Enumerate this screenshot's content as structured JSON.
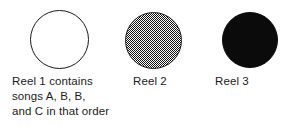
{
  "figure": {
    "background_color": "#ffffff",
    "width": 284,
    "height": 137
  },
  "reels": [
    {
      "id": "reel-1",
      "label": "Reel 1",
      "caption": "Reel 1 contains\nsongs A, B, B,\nand C in that order",
      "fill_style": "empty",
      "fill_color": "#ffffff",
      "stroke_color": "#1a1a1a",
      "contents": [
        "A",
        "B",
        "B",
        "C"
      ],
      "contents_description": "songs A, B, B, and C in that order"
    },
    {
      "id": "reel-2",
      "label": "Reel 2",
      "caption": "Reel 2",
      "fill_style": "dither",
      "fill_color": "#808080",
      "stroke_color": "#1a1a1a",
      "contents": [],
      "contents_description": ""
    },
    {
      "id": "reel-3",
      "label": "Reel 3",
      "caption": "Reel 3",
      "fill_style": "solid",
      "fill_color": "#0b0b0b",
      "stroke_color": "#0b0b0b",
      "contents": [],
      "contents_description": ""
    }
  ]
}
